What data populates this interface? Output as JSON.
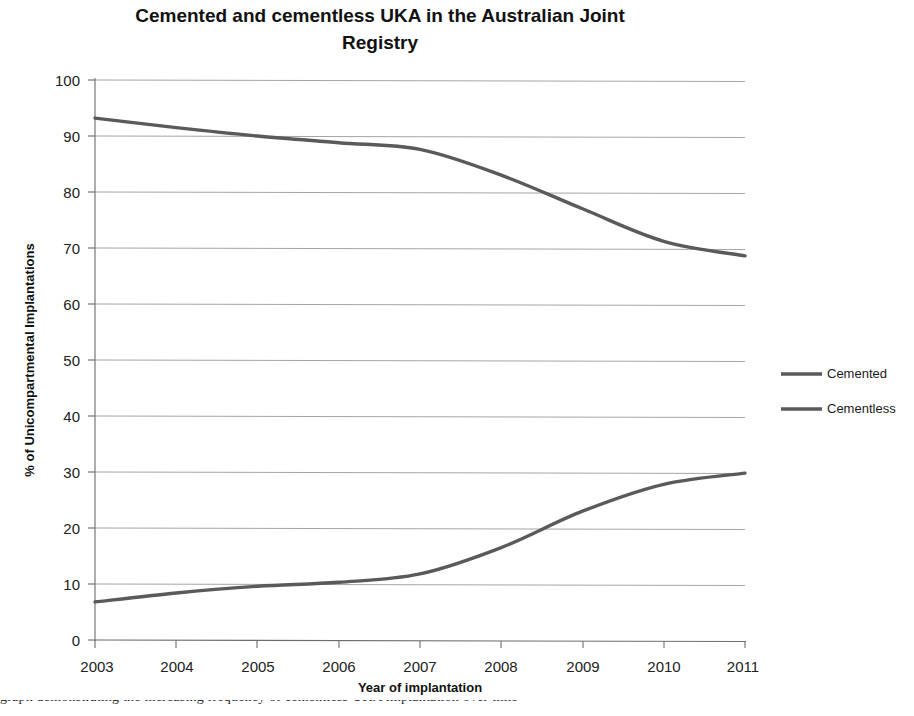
{
  "chart_data": {
    "type": "line",
    "title": "Cemented and cementless UKA in the Australian Joint Registry",
    "title_line1": "Cemented and cementless UKA in the Australian Joint",
    "title_line2": "Registry",
    "xlabel": "Year of implantation",
    "ylabel": "% of Unicompartmental Implantations",
    "x": [
      2003,
      2004,
      2005,
      2006,
      2007,
      2008,
      2009,
      2010,
      2011
    ],
    "categories": [
      "2003",
      "2004",
      "2005",
      "2006",
      "2007",
      "2008",
      "2009",
      "2010",
      "2011"
    ],
    "series": [
      {
        "name": "Cemented",
        "color": "#5a5a5a",
        "values": [
          93.2,
          91.5,
          90.0,
          88.8,
          87.6,
          83.0,
          77.0,
          71.2,
          68.6
        ]
      },
      {
        "name": "Cementless",
        "color": "#5a5a5a",
        "values": [
          6.8,
          8.4,
          9.6,
          10.3,
          11.8,
          16.5,
          23.0,
          27.8,
          29.8
        ]
      }
    ],
    "ylim": [
      0,
      100
    ],
    "ytick_step": 10,
    "yticks": [
      "0",
      "10",
      "20",
      "30",
      "40",
      "50",
      "60",
      "70",
      "80",
      "90",
      "100"
    ],
    "xlim": [
      2003,
      2011
    ],
    "grid": "horizontal",
    "legend_position": "right",
    "legend": [
      "Cemented",
      "Cementless"
    ]
  },
  "figure": {
    "background_color": "#ffffff",
    "grid_color": "#9a9a9a",
    "axis_color": "#6d6d6d",
    "text_color": "#111111"
  },
  "caption": {
    "partial_text": "graph demonstrating the increasing frequency of cementless UKA implantation over time"
  }
}
